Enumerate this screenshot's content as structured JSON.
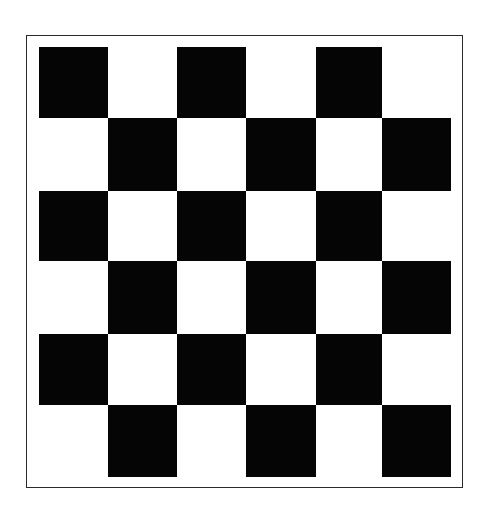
{
  "board": {
    "rows": 6,
    "cols": 6,
    "colors": {
      "dark": "#050505",
      "light": "#ffffff",
      "frame": "#2a2a2a"
    },
    "pattern": [
      [
        "dark",
        "light",
        "dark",
        "light",
        "dark",
        "light"
      ],
      [
        "light",
        "dark",
        "light",
        "dark",
        "light",
        "dark"
      ],
      [
        "dark",
        "light",
        "dark",
        "light",
        "dark",
        "light"
      ],
      [
        "light",
        "dark",
        "light",
        "dark",
        "light",
        "dark"
      ],
      [
        "dark",
        "light",
        "dark",
        "light",
        "dark",
        "light"
      ],
      [
        "light",
        "dark",
        "light",
        "dark",
        "light",
        "dark"
      ]
    ]
  }
}
